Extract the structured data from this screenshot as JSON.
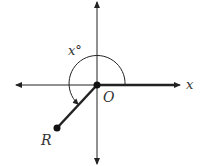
{
  "diagram": {
    "labels": {
      "angle": "x°",
      "origin": "O",
      "point": "R",
      "axis": "x"
    },
    "colors": {
      "stroke": "#222222",
      "text": "#333333",
      "background": "#ffffff"
    }
  }
}
